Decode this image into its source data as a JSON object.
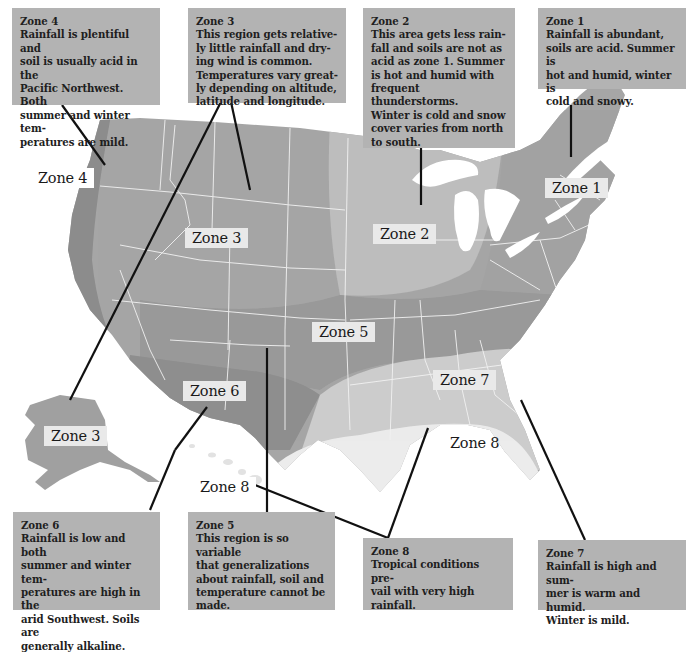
{
  "colors": {
    "background": "#ffffff",
    "note_box": "#b3b3b3",
    "label_box": "#e9e9e9",
    "zone_dark": "#8f8f8f",
    "zone_1": "#a2a2a2",
    "zone_2": "#bdbdbd",
    "zone_3": "#a6a6a6",
    "zone_4": "#8c8c8c",
    "zone_5": "#999999",
    "zone_6": "#8e8e8e",
    "zone_7": "#cccccc",
    "zone_8": "#ececec",
    "state_borders": "#f2f2f2",
    "leader_lines": "#111111"
  },
  "notes": {
    "zone4": {
      "title": "Zone 4",
      "body": "Rainfall is plentiful and\nsoil is usually acid in the\nPacific Northwest. Both\nsummer and winter tem-\nperatures are mild."
    },
    "zone3": {
      "title": "Zone 3",
      "body": "This region gets relative-\nly little rainfall and dry-\ning wind is common.\nTemperatures vary great-\nly depending on altitude,\nlatitude and longitude."
    },
    "zone2": {
      "title": "Zone 2",
      "body": "This area gets less rain-\nfall and soils are not as\nacid as zone 1. Summer\nis hot and humid with\nfrequent thunderstorms.\nWinter is cold and snow\ncover varies from north\nto south."
    },
    "zone1": {
      "title": "Zone 1",
      "body": "Rainfall is abundant,\nsoils are acid. Summer is\nhot and humid, winter is\ncold and snowy."
    },
    "zone6": {
      "title": "Zone 6",
      "body": "Rainfall is low and both\nsummer and winter tem-\nperatures are high in the\narid Southwest. Soils are\ngenerally alkaline."
    },
    "zone5": {
      "title": "Zone 5",
      "body": "This region is so variable\nthat generalizations\nabout rainfall, soil and\ntemperature cannot be\nmade."
    },
    "zone8": {
      "title": "Zone 8",
      "body": "Tropical conditions pre-\nvail with very high\nrainfall."
    },
    "zone7": {
      "title": "Zone 7",
      "body": "Rainfall is high and sum-\nmer is warm and humid.\nWinter is mild."
    }
  },
  "map_labels": {
    "zone4": "Zone 4",
    "zone3_west": "Zone 3",
    "zone2": "Zone 2",
    "zone1": "Zone 1",
    "zone5": "Zone 5",
    "zone6": "Zone 6",
    "zone7": "Zone 7",
    "zone3_alaska": "Zone 3",
    "zone8_gulf": "Zone 8",
    "zone8_hawaii": "Zone 8"
  }
}
